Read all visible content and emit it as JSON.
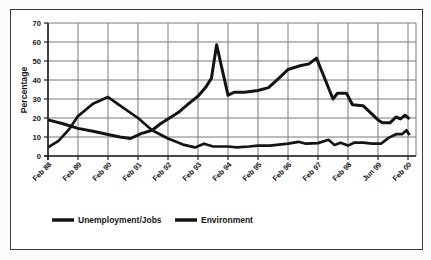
{
  "figure": {
    "background": "#ffffff",
    "border_color": "#3a3a3a",
    "grid_color": "#7a7a7a",
    "axis_color": "#222222",
    "line_color": "#141414"
  },
  "chart_data": {
    "type": "line",
    "title": "",
    "xlabel": "",
    "ylabel": "Percentage",
    "ylim": [
      0,
      70
    ],
    "yticks": [
      0,
      10,
      20,
      30,
      40,
      50,
      60,
      70
    ],
    "xticklabels": [
      "Feb 88",
      "Feb 89",
      "Feb 90",
      "Feb 91",
      "Feb 92",
      "Feb 93",
      "Feb 94",
      "Feb 95",
      "Feb 96",
      "Feb 97",
      "Feb 98",
      "Jun 99",
      "Feb 00"
    ],
    "grid": true,
    "legend_position": "bottom",
    "series": [
      {
        "name": "Unemployment/Jobs",
        "color": "#141414",
        "stroke_width": 3,
        "points": [
          [
            0,
            19
          ],
          [
            0.5,
            17
          ],
          [
            1,
            14.5
          ],
          [
            1.5,
            13
          ],
          [
            2,
            11.3
          ],
          [
            2.4,
            10
          ],
          [
            2.75,
            9.2
          ],
          [
            3.1,
            11.8
          ],
          [
            3.47,
            13.5
          ],
          [
            3.75,
            17
          ],
          [
            4,
            19.5
          ],
          [
            4.35,
            23
          ],
          [
            4.65,
            27
          ],
          [
            5,
            31.5
          ],
          [
            5.25,
            36
          ],
          [
            5.45,
            41
          ],
          [
            5.62,
            58.5
          ],
          [
            6,
            32
          ],
          [
            6.2,
            33.5
          ],
          [
            6.55,
            33.5
          ],
          [
            7,
            34.5
          ],
          [
            7.35,
            36
          ],
          [
            7.7,
            41
          ],
          [
            8,
            45.5
          ],
          [
            8.4,
            47.5
          ],
          [
            8.7,
            48.5
          ],
          [
            8.95,
            51.5
          ],
          [
            9.5,
            30
          ],
          [
            9.65,
            33
          ],
          [
            9.95,
            33
          ],
          [
            10.15,
            27
          ],
          [
            10.5,
            26.5
          ],
          [
            10.8,
            22
          ],
          [
            11,
            19
          ],
          [
            11.15,
            17.5
          ],
          [
            11.4,
            17.5
          ],
          [
            11.6,
            20.5
          ],
          [
            11.75,
            19.5
          ],
          [
            11.9,
            21.5
          ],
          [
            12.05,
            19.5
          ]
        ]
      },
      {
        "name": "Environment",
        "color": "#141414",
        "stroke_width": 2.7,
        "points": [
          [
            0,
            4.5
          ],
          [
            0.35,
            8
          ],
          [
            0.7,
            14
          ],
          [
            1,
            21
          ],
          [
            1.5,
            27.5
          ],
          [
            2,
            31
          ],
          [
            2.5,
            25.5
          ],
          [
            3,
            20
          ],
          [
            3.47,
            13.5
          ],
          [
            4,
            9.2
          ],
          [
            4.5,
            6
          ],
          [
            4.9,
            4.5
          ],
          [
            5.2,
            6.5
          ],
          [
            5.5,
            5
          ],
          [
            6,
            5
          ],
          [
            6.3,
            4.5
          ],
          [
            6.7,
            5
          ],
          [
            7,
            5.5
          ],
          [
            7.4,
            5.5
          ],
          [
            7.7,
            6
          ],
          [
            8,
            6.5
          ],
          [
            8.35,
            7.5
          ],
          [
            8.6,
            6.5
          ],
          [
            9,
            6.8
          ],
          [
            9.35,
            8.5
          ],
          [
            9.55,
            5.8
          ],
          [
            9.75,
            7
          ],
          [
            10,
            5.5
          ],
          [
            10.2,
            7
          ],
          [
            10.5,
            7
          ],
          [
            10.8,
            6.5
          ],
          [
            11.1,
            6.5
          ],
          [
            11.35,
            9.5
          ],
          [
            11.6,
            11.5
          ],
          [
            11.8,
            11.5
          ],
          [
            11.95,
            13.5
          ],
          [
            12.05,
            11
          ]
        ]
      }
    ]
  }
}
